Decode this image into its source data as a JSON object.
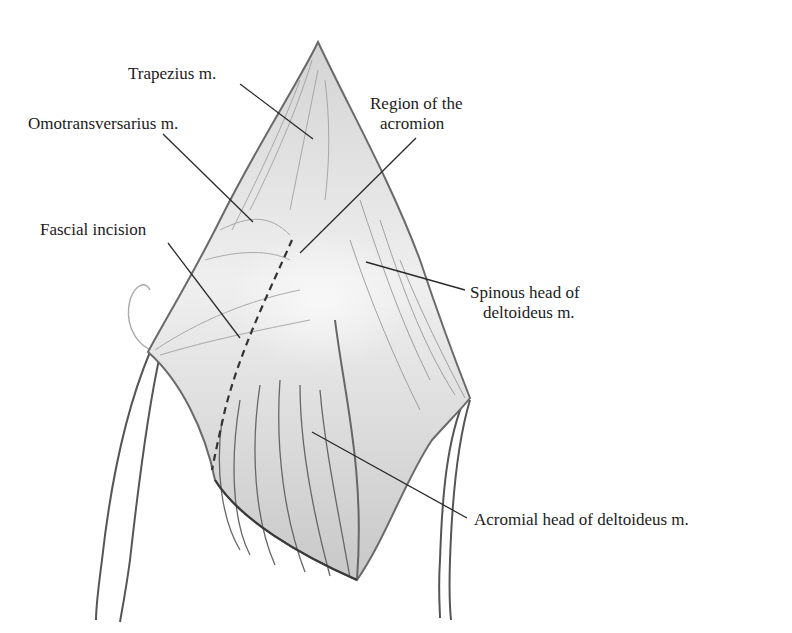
{
  "figure": {
    "colors": {
      "ink": "#1a1a1a",
      "outline": "#3a3a3a",
      "muscle_fill": "#e6e6e6",
      "muscle_shadow": "#b8b8b8",
      "background": "#ffffff"
    }
  },
  "labels": [
    {
      "id": "trapezius",
      "text": "Trapezius m."
    },
    {
      "id": "omotransversarius",
      "text": "Omotransversarius m."
    },
    {
      "id": "region_acromion_line1",
      "text": "Region of the"
    },
    {
      "id": "region_acromion_line2",
      "text": "acromion"
    },
    {
      "id": "fascial_incision",
      "text": "Fascial incision"
    },
    {
      "id": "spinous_head_line1",
      "text": "Spinous head of"
    },
    {
      "id": "spinous_head_line2",
      "text": "deltoideus m."
    },
    {
      "id": "acromial_head",
      "text": "Acromial head of deltoideus m."
    }
  ]
}
